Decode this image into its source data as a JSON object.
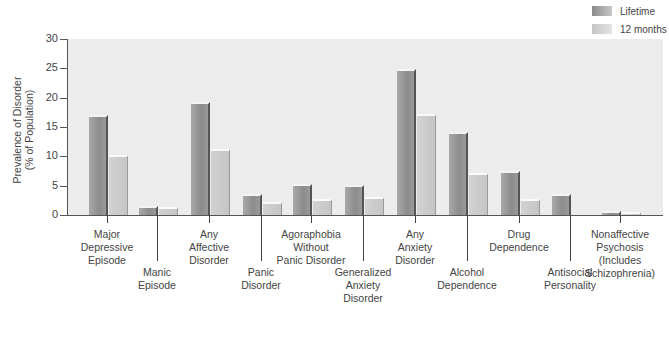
{
  "legend": {
    "items": [
      {
        "label": "Lifetime"
      },
      {
        "label": "12 months"
      }
    ]
  },
  "axis": {
    "ylabel": "Prevalence of Disorder\n(% of Population)",
    "yticks": [
      "0",
      "5",
      "10",
      "15",
      "20",
      "25",
      "30"
    ]
  },
  "categories": [
    {
      "label": "Major\nDepressive\nEpisode",
      "low": false
    },
    {
      "label": "Manic\nEpisode",
      "low": true
    },
    {
      "label": "Any\nAffective\nDisorder",
      "low": false
    },
    {
      "label": "Panic\nDisorder",
      "low": true
    },
    {
      "label": "Agoraphobia\nWithout\nPanic Disorder",
      "low": false
    },
    {
      "label": "Generalized\nAnxiety\nDisorder",
      "low": true
    },
    {
      "label": "Any\nAnxiety\nDisorder",
      "low": false
    },
    {
      "label": "Alcohol\nDependence",
      "low": true
    },
    {
      "label": "Drug\nDependence",
      "low": false
    },
    {
      "label": "Antisocial\nPersonality",
      "low": true
    },
    {
      "label": "Nonaffective\nPsychosis\n(Includes\nSchizophrenia)",
      "low": false
    }
  ],
  "chart_data": {
    "type": "bar",
    "title": "",
    "xlabel": "",
    "ylabel": "Prevalence of Disorder (% of Population)",
    "ylim": [
      0,
      30
    ],
    "yticks": [
      0,
      5,
      10,
      15,
      20,
      25,
      30
    ],
    "grid": false,
    "legend_position": "top-right",
    "categories": [
      "Major Depressive Episode",
      "Manic Episode",
      "Any Affective Disorder",
      "Panic Disorder",
      "Agoraphobia Without Panic Disorder",
      "Generalized Anxiety Disorder",
      "Any Anxiety Disorder",
      "Alcohol Dependence",
      "Drug Dependence",
      "Antisocial Personality",
      "Nonaffective Psychosis (Includes Schizophrenia)"
    ],
    "series": [
      {
        "name": "Lifetime",
        "values": [
          17.1,
          1.6,
          19.3,
          3.5,
          5.3,
          5.1,
          24.9,
          14.1,
          7.5,
          3.5,
          0.7
        ]
      },
      {
        "name": "12 months",
        "values": [
          10.3,
          1.3,
          11.3,
          2.3,
          2.8,
          3.1,
          17.2,
          7.2,
          2.8,
          null,
          0.5
        ]
      }
    ]
  }
}
